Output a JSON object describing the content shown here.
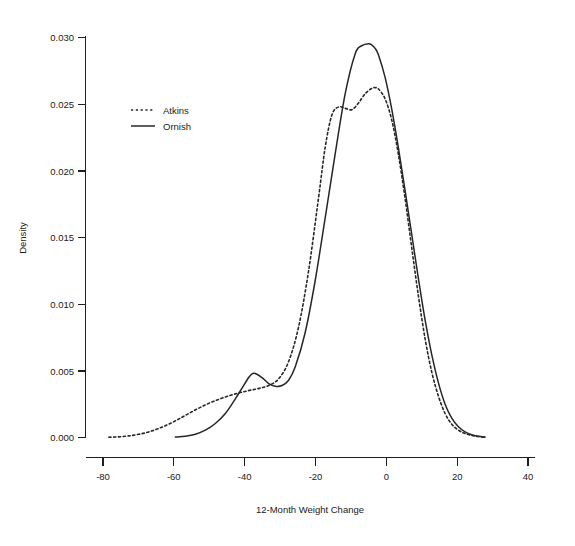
{
  "chart_data": {
    "type": "line",
    "title": "",
    "subtitle": "",
    "xlabel": "12-Month Weight Change",
    "ylabel": "Density",
    "xlim": [
      -90,
      45
    ],
    "ylim": [
      0.0,
      0.0305
    ],
    "xticks": [
      -80,
      -60,
      -40,
      -20,
      0,
      20,
      40
    ],
    "xtick_labels": [
      "-80",
      "-60",
      "-40",
      "-20",
      "0",
      "20",
      "40"
    ],
    "yticks": [
      0.0,
      0.005,
      0.01,
      0.015,
      0.02,
      0.025,
      0.03
    ],
    "ytick_labels": [
      "0.000",
      "0.005",
      "0.010",
      "0.015",
      "0.020",
      "0.025",
      "0.030"
    ],
    "grid": false,
    "legend_position": "upper-left-inset",
    "legend": [
      {
        "name": "Atkins",
        "style": "dashed"
      },
      {
        "name": "Ornish",
        "style": "solid"
      }
    ],
    "series": [
      {
        "name": "Atkins",
        "style": "dashed",
        "x": [
          -83,
          -80,
          -77,
          -74,
          -71,
          -68,
          -65,
          -62,
          -59,
          -56,
          -53,
          -50,
          -47,
          -44,
          -41,
          -38,
          -35,
          -32,
          -29,
          -26,
          -23,
          -20,
          -18,
          -16,
          -14,
          -12,
          -10,
          -8,
          -6,
          -4,
          -3,
          -2,
          0,
          2,
          4,
          6,
          8,
          10,
          12,
          14,
          16,
          18,
          20,
          22,
          24,
          26,
          28,
          30
        ],
        "y": [
          2e-05,
          5e-05,
          0.00012,
          0.00024,
          0.00042,
          0.00068,
          0.001,
          0.00138,
          0.0018,
          0.0022,
          0.00256,
          0.00286,
          0.00312,
          0.00334,
          0.00352,
          0.00368,
          0.0039,
          0.0044,
          0.0057,
          0.0083,
          0.0125,
          0.018,
          0.0218,
          0.0242,
          0.0248,
          0.0247,
          0.0246,
          0.0251,
          0.0258,
          0.0262,
          0.02625,
          0.02615,
          0.0254,
          0.0238,
          0.0212,
          0.0179,
          0.0142,
          0.0106,
          0.0074,
          0.0049,
          0.0031,
          0.0018,
          0.001,
          0.00055,
          0.0003,
          0.00015,
          7e-05,
          2e-05
        ]
      },
      {
        "name": "Ornish",
        "style": "solid",
        "x": [
          -63,
          -60,
          -57,
          -54,
          -51,
          -48,
          -45,
          -43,
          -41,
          -40,
          -39,
          -37,
          -35,
          -33,
          -31,
          -29,
          -27,
          -24,
          -21,
          -18,
          -15,
          -12,
          -9,
          -7,
          -5,
          -4,
          -3,
          -2,
          0,
          2,
          4,
          6,
          8,
          10,
          12,
          14,
          16,
          18,
          20,
          22,
          24,
          26,
          28,
          30
        ],
        "y": [
          3e-05,
          0.0001,
          0.00025,
          0.00055,
          0.00105,
          0.0018,
          0.0029,
          0.0037,
          0.0045,
          0.00478,
          0.0048,
          0.0045,
          0.00405,
          0.00385,
          0.0039,
          0.0043,
          0.0053,
          0.0079,
          0.0118,
          0.0165,
          0.0213,
          0.0258,
          0.0288,
          0.0294,
          0.02955,
          0.02945,
          0.0292,
          0.0287,
          0.027,
          0.0246,
          0.0217,
          0.0185,
          0.0152,
          0.0119,
          0.0088,
          0.0062,
          0.0041,
          0.0025,
          0.00145,
          0.0008,
          0.00042,
          0.0002,
          9e-05,
          3e-05
        ]
      }
    ]
  },
  "colors": {
    "line": "#262626",
    "axis": "#1f1f1f",
    "background": "#ffffff"
  }
}
